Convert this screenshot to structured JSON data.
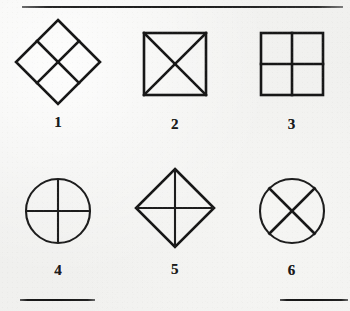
{
  "plate": {
    "background_color": "#f1f1ef",
    "ink_color": "#171717",
    "rules": {
      "top_rule": "horizontal-rule",
      "bottom_left_rule": "horizontal-rule",
      "bottom_right_rule": "horizontal-rule"
    }
  },
  "figures": [
    {
      "number": "1",
      "shape": "diamond-divided-into-four-diamonds",
      "icon": "diamond-quartered-icon",
      "description": "Diamond (square rotated 45 degrees) subdivided into four smaller diamonds by lines joining the midpoints of its sides"
    },
    {
      "number": "2",
      "shape": "square-with-diagonals",
      "icon": "square-x-icon",
      "description": "Square with both diagonals drawn, forming an X inside"
    },
    {
      "number": "3",
      "shape": "square-with-midlines",
      "icon": "square-cross-icon",
      "description": "Square divided into four equal squares by vertical and horizontal midlines"
    },
    {
      "number": "4",
      "shape": "circle-with-diameters",
      "icon": "circle-cross-icon",
      "description": "Circle with vertical and horizontal diameters forming a plus inside"
    },
    {
      "number": "5",
      "shape": "diamond-with-diagonals",
      "icon": "diamond-cross-icon",
      "description": "Diamond with vertical and horizontal diagonals joining opposite vertices"
    },
    {
      "number": "6",
      "shape": "circle-with-x",
      "icon": "circle-x-icon",
      "description": "Circle with two oblique chords crossing at the centre forming an X"
    }
  ]
}
